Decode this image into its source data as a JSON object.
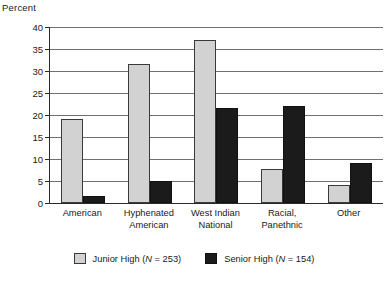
{
  "chart_data": {
    "type": "bar",
    "title": "",
    "xlabel": "",
    "ylabel": "Percent",
    "ylim": [
      0,
      40
    ],
    "yticks": [
      0,
      5,
      10,
      15,
      20,
      25,
      30,
      35,
      40
    ],
    "grid": true,
    "legend_position": "bottom",
    "categories": [
      "American",
      "Hyphenated American",
      "West Indian National",
      "Racial, Panethnic",
      "Other"
    ],
    "category_lines": [
      [
        "American"
      ],
      [
        "Hyphenated",
        "American"
      ],
      [
        "West Indian",
        "National"
      ],
      [
        "Racial,",
        "Panethnic"
      ],
      [
        "Other"
      ]
    ],
    "series": [
      {
        "name": "Junior High (N = 253)",
        "color": "#d2d2d2",
        "values": [
          19,
          31.5,
          37,
          7.7,
          4
        ]
      },
      {
        "name": "Senior High (N = 154)",
        "color": "#1b1b1b",
        "values": [
          1.5,
          5,
          21.5,
          22,
          9
        ]
      }
    ]
  },
  "legend": {
    "items": [
      {
        "label": "Junior High (N = 253)",
        "swatch": "junior"
      },
      {
        "label": "Senior High (N = 154)",
        "swatch": "senior"
      }
    ]
  },
  "axis": {
    "y_title": "Percent"
  }
}
